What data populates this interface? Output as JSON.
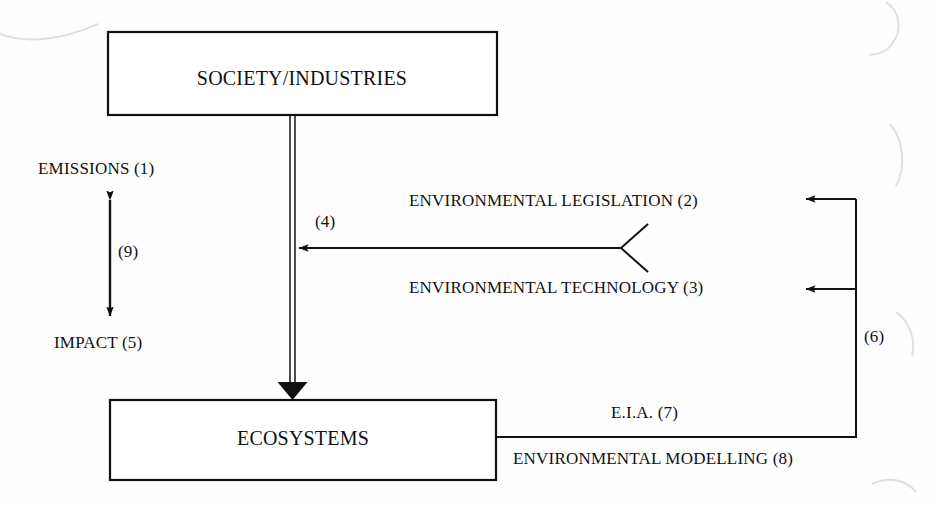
{
  "diagram": {
    "boxes": [
      {
        "id": "society",
        "label": "SOCIETY/INDUSTRIES"
      },
      {
        "id": "ecosystems",
        "label": "ECOSYSTEMS"
      }
    ],
    "labels": {
      "emissions": "EMISSIONS (1)",
      "impact": "IMPACT (5)",
      "legislation": "ENVIRONMENTAL LEGISLATION (2)",
      "technology": "ENVIRONMENTAL TECHNOLOGY (3)",
      "eia": "E.I.A. (7)",
      "modelling": "ENVIRONMENTAL MODELLING (8)"
    },
    "refs": {
      "emissions_impact": "(9)",
      "control_inflow": "(4)",
      "feedback": "(6)"
    },
    "colors": {
      "ink": "#111111",
      "paper": "#fefefe",
      "artifact": "#e3e3e3"
    }
  }
}
